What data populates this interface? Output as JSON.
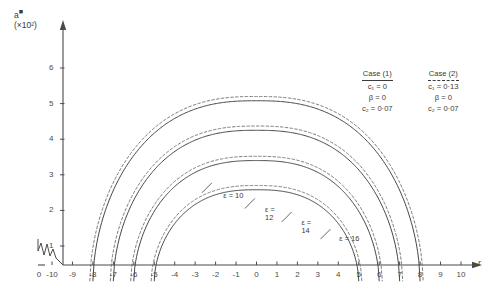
{
  "chart_data": {
    "type": "line",
    "title": "",
    "ylabel": "a",
    "ylabel_scale": "(×10²)",
    "xlabel": "r",
    "xlim": [
      -10.6,
      10.6
    ],
    "ylim": [
      0,
      6.6
    ],
    "grid": false,
    "x_ticks": [
      -10,
      -9,
      -8,
      -7,
      -6,
      -5,
      -4,
      -3,
      -2,
      -1,
      0,
      1,
      2,
      3,
      4,
      5,
      6,
      7,
      8,
      9,
      10
    ],
    "x_tick_labels": [
      "-10",
      "-9",
      "-8",
      "-7",
      "-6",
      "-5",
      "-4",
      "-3",
      "-2",
      "-1",
      "0",
      "1",
      "2",
      "3",
      "4",
      "5",
      "6",
      "7",
      "8",
      "9",
      "10"
    ],
    "y_ticks": [
      1,
      2,
      3,
      4,
      5,
      6
    ],
    "y_tick_labels": [
      "1",
      "2",
      "3",
      "4",
      "5",
      "6"
    ],
    "origin_label": "0",
    "axis_break": true,
    "series": [
      {
        "name": "ε = 10, Case (1)",
        "epsilon": 10,
        "style": "solid",
        "x_start": -8.0,
        "x_end": 8.0,
        "peak": 5.08,
        "label": "ε = 10"
      },
      {
        "name": "ε = 10, Case (2)",
        "epsilon": 10,
        "style": "dashed",
        "x_start": -8.15,
        "x_end": 8.15,
        "peak": 5.2
      },
      {
        "name": "ε = 12, Case (1)",
        "epsilon": 12,
        "style": "solid",
        "x_start": -7.0,
        "x_end": 7.0,
        "peak": 4.25,
        "label": "ε = 12"
      },
      {
        "name": "ε = 12, Case (2)",
        "epsilon": 12,
        "style": "dashed",
        "x_start": -7.15,
        "x_end": 7.15,
        "peak": 4.37
      },
      {
        "name": "ε = 14, Case (1)",
        "epsilon": 14,
        "style": "solid",
        "x_start": -6.0,
        "x_end": 6.0,
        "peak": 3.4,
        "label": "ε = 14"
      },
      {
        "name": "ε = 14, Case (2)",
        "epsilon": 14,
        "style": "dashed",
        "x_start": -6.15,
        "x_end": 6.15,
        "peak": 3.52
      },
      {
        "name": "ε = 16, Case (1)",
        "epsilon": 16,
        "style": "solid",
        "x_start": -5.0,
        "x_end": 5.0,
        "peak": 2.58,
        "label": "ε = 16"
      },
      {
        "name": "ε = 16, Case (2)",
        "epsilon": 16,
        "style": "dashed",
        "x_start": -5.15,
        "x_end": 5.15,
        "peak": 2.7
      }
    ],
    "annotations": [
      {
        "text": "ε = 10",
        "x": -1.6,
        "y": 2.35
      },
      {
        "text": "ε =",
        "text2": "12",
        "x": 0.45,
        "y": 1.95
      },
      {
        "text": "ε =",
        "text2": "14",
        "x": 2.2,
        "y": 1.6
      },
      {
        "text": "ε = 16",
        "x": 4.1,
        "y": 1.15
      }
    ],
    "legend": {
      "position": "top-right",
      "entries": [
        {
          "title": "Case (1)",
          "rule": "solid",
          "params": [
            "c₁ = 0",
            "β = 0",
            "c₂ = 0·07"
          ]
        },
        {
          "title": "Case (2)",
          "rule": "dashed",
          "params": [
            "c₁ = 0·13",
            "β = 0",
            "c₂ = 0·07"
          ]
        }
      ]
    },
    "colors": {
      "axis": "#4a4a4a",
      "solid_curve": "#3d3d3d",
      "dashed_curve": "#6e6e6e",
      "background": "#ffffff"
    }
  }
}
